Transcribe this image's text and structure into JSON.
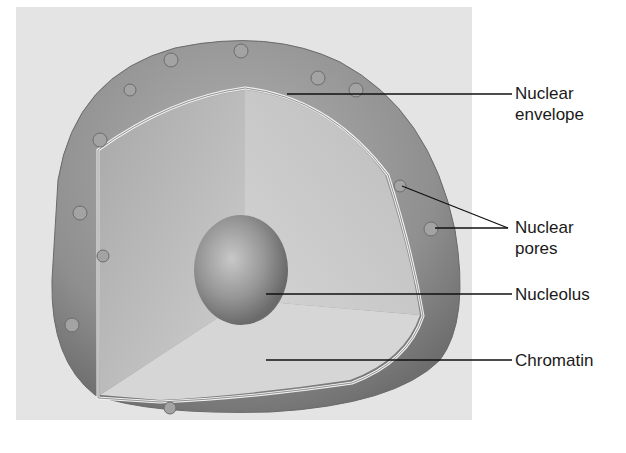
{
  "diagram": {
    "colors": {
      "background_panel": "#e4e4e4",
      "envelope_outer": "#8e8e8e",
      "interior": "#c9c9c9",
      "leader_lines": "#111111"
    },
    "labels": [
      {
        "id": "nuclear-envelope",
        "lines": [
          "Nuclear",
          "envelope"
        ]
      },
      {
        "id": "nuclear-pores",
        "lines": [
          "Nuclear",
          "pores"
        ]
      },
      {
        "id": "nucleolus",
        "lines": [
          "Nucleolus"
        ]
      },
      {
        "id": "chromatin",
        "lines": [
          "Chromatin"
        ]
      }
    ]
  }
}
